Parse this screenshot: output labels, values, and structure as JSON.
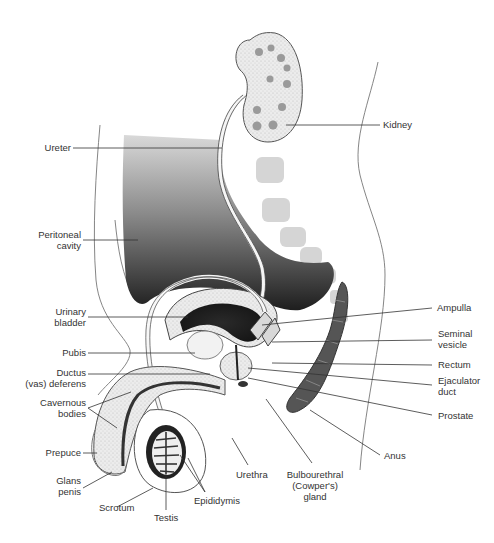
{
  "diagram": {
    "colors": {
      "ink": "#333333",
      "shade_dark": "#2a2a2a",
      "shade_mid": "#8a8a8a",
      "stipple": "#cfcfcf",
      "background": "#ffffff"
    },
    "labels": {
      "kidney": [
        "Kidney"
      ],
      "ureter": [
        "Ureter"
      ],
      "peritoneal_cavity": [
        "Peritoneal",
        "cavity"
      ],
      "urinary_bladder": [
        "Urinary",
        "bladder"
      ],
      "pubis": [
        "Pubis"
      ],
      "ductus_deferens": [
        "Ductus",
        "(vas) deferens"
      ],
      "cavernous_bodies": [
        "Cavernous",
        "bodies"
      ],
      "prepuce": [
        "Prepuce"
      ],
      "glans_penis": [
        "Glans",
        "penis"
      ],
      "scrotum": [
        "Scrotum"
      ],
      "testis": [
        "Testis"
      ],
      "epididymis": [
        "Epididymis"
      ],
      "urethra": [
        "Urethra"
      ],
      "bulbourethral_gland": [
        "Bulbourethral",
        "(Cowper's)",
        "gland"
      ],
      "anus": [
        "Anus"
      ],
      "prostate": [
        "Prostate"
      ],
      "ejaculator_duct": [
        "Ejaculator",
        "duct"
      ],
      "rectum": [
        "Rectum"
      ],
      "seminal_vesicle": [
        "Seminal",
        "vesicle"
      ],
      "ampulla": [
        "Ampulla"
      ]
    }
  }
}
